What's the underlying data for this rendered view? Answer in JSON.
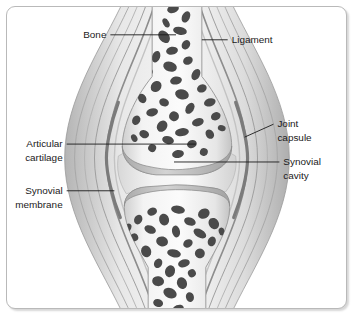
{
  "figure": {
    "background_color": "#ffffff",
    "frame_border_color": "#b9b9b9"
  },
  "labels": [
    {
      "id": "bone",
      "text": "Bone",
      "text_line2": "",
      "side": "left",
      "leader": "horizontal"
    },
    {
      "id": "ligament",
      "text": "Ligament",
      "text_line2": "",
      "side": "right",
      "leader": "horizontal"
    },
    {
      "id": "articular-cartilage",
      "text": "Articular",
      "text_line2": "cartilage",
      "side": "left",
      "leader": "horizontal"
    },
    {
      "id": "synovial-membrane",
      "text": "Synovial",
      "text_line2": "membrane",
      "side": "left",
      "leader": "horizontal"
    },
    {
      "id": "joint-capsule",
      "text": "Joint",
      "text_line2": "capsule",
      "side": "right",
      "leader": "diagonal"
    },
    {
      "id": "synovial-cavity",
      "text": "Synovial",
      "text_line2": "cavity",
      "side": "right",
      "leader": "horizontal"
    }
  ],
  "anatomy": {
    "structures": [
      {
        "id": "upper-bone",
        "name": "Upper bone (epiphysis and shaft)",
        "fill": "#efefef"
      },
      {
        "id": "lower-bone",
        "name": "Lower bone (epiphysis and shaft)",
        "fill": "#efefef"
      },
      {
        "id": "trabecular-bone",
        "name": "Spongy / trabecular bone marking",
        "fill": "#4a4a4a"
      },
      {
        "id": "articular-cartilage",
        "name": "Articular cartilage cap",
        "fill": "#c9c9c9"
      },
      {
        "id": "synovial-cavity",
        "name": "Synovial cavity",
        "fill": "#f2f2f2"
      },
      {
        "id": "synovial-membrane",
        "name": "Synovial membrane band",
        "fill": "#8f8f8f"
      },
      {
        "id": "joint-capsule",
        "name": "Joint capsule layers",
        "fill": "#d6d6d6"
      },
      {
        "id": "ligament",
        "name": "Ligament fibre bands",
        "fill": "#cfcfcf"
      }
    ],
    "colors": {
      "bone_light": "#efefef",
      "bone_mid": "#dcdcdc",
      "trabecula": "#4a4a4a",
      "cartilage": "#c8c8c8",
      "capsule": "#d4d4d4",
      "membrane": "#8c8c8c",
      "outline": "#8a8a8a"
    }
  }
}
